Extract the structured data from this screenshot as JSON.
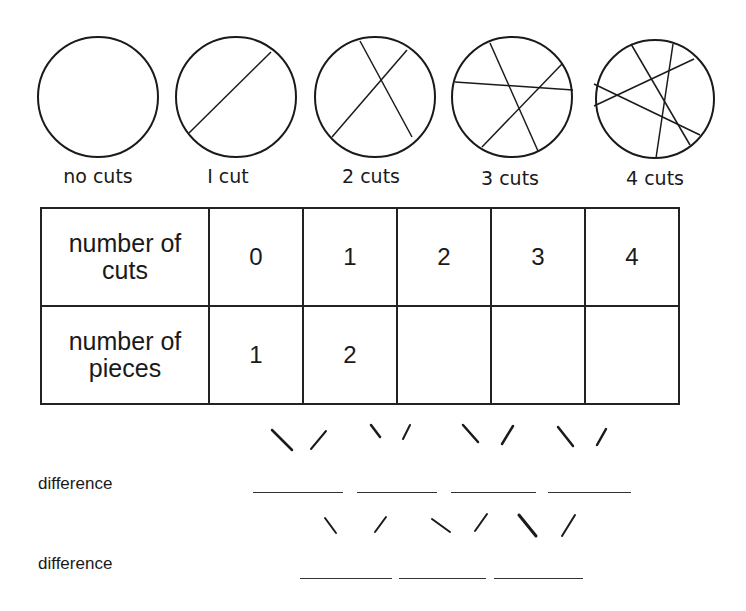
{
  "circles": [
    {
      "label": "no cuts",
      "cuts": 0
    },
    {
      "label": "I cut",
      "cuts": 1
    },
    {
      "label": "2 cuts",
      "cuts": 2
    },
    {
      "label": "3 cuts",
      "cuts": 3
    },
    {
      "label": "4 cuts",
      "cuts": 4
    }
  ],
  "table": {
    "rows": [
      {
        "header": [
          "number of",
          "cuts"
        ],
        "values": [
          "0",
          "1",
          "2",
          "3",
          "4"
        ]
      },
      {
        "header": [
          "number of",
          "pieces"
        ],
        "values": [
          "1",
          "2",
          "",
          "",
          ""
        ]
      }
    ]
  },
  "differences": [
    {
      "label": "difference",
      "blanks": 4
    },
    {
      "label": "difference",
      "blanks": 3
    }
  ]
}
